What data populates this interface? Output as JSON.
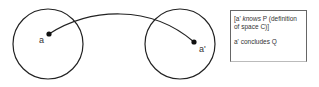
{
  "diagram": {
    "left_space": {
      "point_label": "a"
    },
    "right_space": {
      "point_label": "a'"
    },
    "note": {
      "line1_prefix": "[a' ",
      "line1_italic": "knows",
      "line1_suffix": " P (definition of space C)]",
      "line2": "a' concludes Q"
    },
    "colors": {
      "stroke": "#222222",
      "text": "#333333",
      "box_border": "#666666"
    }
  }
}
